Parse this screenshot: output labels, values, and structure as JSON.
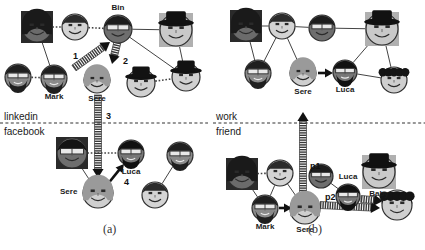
{
  "figure": {
    "panels": [
      {
        "id": "a",
        "caption": "(a)",
        "caption_pos": {
          "x": 103,
          "y": 222
        },
        "network_labels": [
          {
            "name": "linkedin",
            "text": "linkedin",
            "x": 4,
            "y": 112
          },
          {
            "name": "facebook",
            "text": "facebook",
            "x": 4,
            "y": 127
          }
        ],
        "divider_y": 123,
        "divider_x1": 0,
        "divider_x2": 208,
        "nodes": [
          {
            "id": "a1",
            "label": "",
            "x": 37,
            "y": 27,
            "r": 16,
            "shape": "square",
            "skin": "#6b6b6b",
            "hair": "#1a1a1a",
            "hairstyle": "long",
            "glasses": false,
            "hat": false,
            "beard": false
          },
          {
            "id": "a2",
            "label": "",
            "x": 75,
            "y": 27,
            "r": 14,
            "shape": "circle",
            "skin": "#d4d4d4",
            "hair": "#2b2b2b",
            "hairstyle": "short",
            "glasses": false,
            "hat": false,
            "beard": false
          },
          {
            "id": "bin",
            "label": "Bin",
            "x": 118,
            "y": 29,
            "r": 15,
            "shape": "circle",
            "skin": "#6e6e6e",
            "hair": "#1c1c1c",
            "hairstyle": "short",
            "glasses": true,
            "hat": false,
            "beard": false,
            "label_pos": "top"
          },
          {
            "id": "a4",
            "label": "",
            "x": 176,
            "y": 30,
            "r": 17,
            "shape": "square",
            "skin": "#c9c9c9",
            "hair": "#111111",
            "hairstyle": "hat",
            "glasses": false,
            "hat": true,
            "beard": false
          },
          {
            "id": "a5",
            "label": "",
            "x": 18,
            "y": 77,
            "r": 14,
            "shape": "circle",
            "skin": "#8a8a8a",
            "hair": "#1f1f1f",
            "hairstyle": "short",
            "glasses": true,
            "hat": false,
            "beard": true
          },
          {
            "id": "mark",
            "label": "Mark",
            "x": 54,
            "y": 78,
            "r": 14,
            "shape": "circle",
            "skin": "#8a8a8a",
            "hair": "#1f1f1f",
            "hairstyle": "short",
            "glasses": true,
            "hat": false,
            "beard": true,
            "label_pos": "bottom"
          },
          {
            "id": "sere1",
            "label": "Sere",
            "x": 97,
            "y": 80,
            "r": 14,
            "shape": "circle",
            "skin": "#cfcfcf",
            "hair": "#9a9a9a",
            "hairstyle": "long",
            "glasses": false,
            "hat": false,
            "beard": false,
            "label_pos": "bottom"
          },
          {
            "id": "a8",
            "label": "",
            "x": 141,
            "y": 83,
            "r": 15,
            "shape": "circle",
            "skin": "#d0d0d0",
            "hair": "#121212",
            "hairstyle": "hat",
            "glasses": false,
            "hat": true,
            "beard": false
          },
          {
            "id": "a9",
            "label": "",
            "x": 186,
            "y": 77,
            "r": 15,
            "shape": "circle",
            "skin": "#d0d0d0",
            "hair": "#121212",
            "hairstyle": "hat",
            "glasses": false,
            "hat": true,
            "beard": false
          },
          {
            "id": "a10",
            "label": "",
            "x": 72,
            "y": 153,
            "r": 16,
            "shape": "square",
            "skin": "#6e6e6e",
            "hair": "#141414",
            "hairstyle": "short",
            "glasses": true,
            "hat": false,
            "beard": false
          },
          {
            "id": "luca1",
            "label": "Luca",
            "x": 131,
            "y": 153,
            "r": 14,
            "shape": "circle",
            "skin": "#777777",
            "hair": "#111111",
            "hairstyle": "short",
            "glasses": true,
            "hat": false,
            "beard": true,
            "label_pos": "bottom"
          },
          {
            "id": "a12",
            "label": "",
            "x": 180,
            "y": 155,
            "r": 14,
            "shape": "circle",
            "skin": "#8a8a8a",
            "hair": "#1f1f1f",
            "hairstyle": "short",
            "glasses": true,
            "hat": false,
            "beard": true
          },
          {
            "id": "sere2",
            "label": "Sere",
            "x": 98,
            "y": 193,
            "r": 16,
            "shape": "circle",
            "skin": "#cfcfcf",
            "hair": "#9a9a9a",
            "hairstyle": "long",
            "glasses": false,
            "hat": false,
            "beard": false,
            "label_pos": "left"
          },
          {
            "id": "a14",
            "label": "",
            "x": 155,
            "y": 195,
            "r": 14,
            "shape": "circle",
            "skin": "#d4d4d4",
            "hair": "#2b2b2b",
            "hairstyle": "short",
            "glasses": false,
            "hat": false,
            "beard": false
          }
        ],
        "edges": [
          {
            "from": "a1",
            "to": "a2",
            "style": "dotted"
          },
          {
            "from": "a2",
            "to": "bin",
            "style": "dotted"
          },
          {
            "from": "a1",
            "to": "mark",
            "style": "solid"
          },
          {
            "from": "a5",
            "to": "mark",
            "style": "dotted"
          },
          {
            "from": "bin",
            "to": "a4",
            "style": "solid"
          },
          {
            "from": "bin",
            "to": "a9",
            "style": "solid"
          },
          {
            "from": "a4",
            "to": "a9",
            "style": "solid"
          },
          {
            "from": "a8",
            "to": "a9",
            "style": "dotted"
          },
          {
            "from": "a10",
            "to": "sere2",
            "style": "solid"
          },
          {
            "from": "a10",
            "to": "luca1",
            "style": "dotted"
          },
          {
            "from": "a12",
            "to": "a14",
            "style": "solid"
          }
        ],
        "flows": [
          {
            "name": "flow-1",
            "label": "1",
            "label_x": 73,
            "label_y": 52,
            "from": {
              "x": 74,
              "y": 68
            },
            "to": {
              "x": 110,
              "y": 42
            },
            "kind": "hatched"
          },
          {
            "name": "flow-2",
            "label": "2",
            "label_x": 123,
            "label_y": 57,
            "from": {
              "x": 118,
              "y": 40
            },
            "to": {
              "x": 112,
              "y": 64
            },
            "kind": "hatched"
          },
          {
            "name": "flow-3",
            "label": "3",
            "label_x": 106,
            "label_y": 112,
            "from": {
              "x": 98,
              "y": 95
            },
            "to": {
              "x": 98,
              "y": 178
            },
            "kind": "hatched"
          },
          {
            "name": "flow-4",
            "label": "4",
            "label_x": 124,
            "label_y": 178,
            "from": {
              "x": 107,
              "y": 185
            },
            "to": {
              "x": 124,
              "y": 164
            },
            "kind": "solid-arrow"
          }
        ]
      },
      {
        "id": "b",
        "caption": "(b)",
        "caption_pos": {
          "x": 308,
          "y": 222
        },
        "network_labels": [
          {
            "name": "work",
            "text": "work",
            "x": 216,
            "y": 112
          },
          {
            "name": "friend",
            "text": "friend",
            "x": 216,
            "y": 127
          }
        ],
        "divider_y": 123,
        "divider_x1": 213,
        "divider_x2": 425,
        "nodes": [
          {
            "id": "b1",
            "label": "",
            "x": 246,
            "y": 26,
            "r": 16,
            "shape": "square",
            "skin": "#6b6b6b",
            "hair": "#1a1a1a",
            "hairstyle": "long",
            "glasses": false,
            "hat": false,
            "beard": false
          },
          {
            "id": "b2",
            "label": "",
            "x": 282,
            "y": 26,
            "r": 14,
            "shape": "circle",
            "skin": "#d4d4d4",
            "hair": "#2b2b2b",
            "hairstyle": "short",
            "glasses": false,
            "hat": false,
            "beard": false
          },
          {
            "id": "b3",
            "label": "",
            "x": 322,
            "y": 28,
            "r": 14,
            "shape": "circle",
            "skin": "#6e6e6e",
            "hair": "#1c1c1c",
            "hairstyle": "short",
            "glasses": true,
            "hat": false,
            "beard": false
          },
          {
            "id": "b4",
            "label": "",
            "x": 382,
            "y": 29,
            "r": 17,
            "shape": "square",
            "skin": "#c9c9c9",
            "hair": "#111111",
            "hairstyle": "hat",
            "glasses": false,
            "hat": true,
            "beard": false
          },
          {
            "id": "b5",
            "label": "",
            "x": 258,
            "y": 73,
            "r": 14,
            "shape": "circle",
            "skin": "#8a8a8a",
            "hair": "#1f1f1f",
            "hairstyle": "short",
            "glasses": true,
            "hat": false,
            "beard": true
          },
          {
            "id": "sereb1",
            "label": "Sere",
            "x": 303,
            "y": 73,
            "r": 14,
            "shape": "circle",
            "skin": "#cfcfcf",
            "hair": "#9a9a9a",
            "hairstyle": "long",
            "glasses": false,
            "hat": false,
            "beard": false,
            "label_pos": "bottom"
          },
          {
            "id": "lucab1",
            "label": "Luca",
            "x": 345,
            "y": 72,
            "r": 13,
            "shape": "circle",
            "skin": "#777777",
            "hair": "#111111",
            "hairstyle": "short",
            "glasses": true,
            "hat": false,
            "beard": true,
            "label_pos": "bottom"
          },
          {
            "id": "b8",
            "label": "",
            "x": 394,
            "y": 80,
            "r": 14,
            "shape": "circle",
            "skin": "#cfcfcf",
            "hair": "#141414",
            "hairstyle": "curly",
            "glasses": false,
            "hat": false,
            "beard": false
          },
          {
            "id": "b9",
            "label": "",
            "x": 242,
            "y": 174,
            "r": 16,
            "shape": "square",
            "skin": "#6b6b6b",
            "hair": "#1a1a1a",
            "hairstyle": "long",
            "glasses": false,
            "hat": false,
            "beard": false
          },
          {
            "id": "b10",
            "label": "",
            "x": 280,
            "y": 173,
            "r": 14,
            "shape": "circle",
            "skin": "#d4d4d4",
            "hair": "#2b2b2b",
            "hairstyle": "short",
            "glasses": false,
            "hat": false,
            "beard": false
          },
          {
            "id": "b11",
            "label": "",
            "x": 321,
            "y": 176,
            "r": 13,
            "shape": "circle",
            "skin": "#6e6e6e",
            "hair": "#1c1c1c",
            "hairstyle": "short",
            "glasses": true,
            "hat": false,
            "beard": false
          },
          {
            "id": "baby",
            "label": "Baby",
            "x": 379,
            "y": 172,
            "r": 17,
            "shape": "square",
            "skin": "#c9c9c9",
            "hair": "#111111",
            "hairstyle": "hat",
            "glasses": false,
            "hat": true,
            "beard": false,
            "label_pos": "bottom"
          },
          {
            "id": "markb",
            "label": "Mark",
            "x": 265,
            "y": 208,
            "r": 14,
            "shape": "circle",
            "skin": "#8a8a8a",
            "hair": "#1f1f1f",
            "hairstyle": "short",
            "glasses": true,
            "hat": false,
            "beard": true,
            "label_pos": "bottom"
          },
          {
            "id": "sereb2",
            "label": "Sere",
            "x": 305,
            "y": 209,
            "r": 16,
            "shape": "circle",
            "skin": "#cfcfcf",
            "hair": "#9a9a9a",
            "hairstyle": "long",
            "glasses": false,
            "hat": false,
            "beard": false,
            "label_pos": "bottom"
          },
          {
            "id": "lucab2",
            "label": "Luca",
            "x": 348,
            "y": 196,
            "r": 13,
            "shape": "circle",
            "skin": "#777777",
            "hair": "#111111",
            "hairstyle": "short",
            "glasses": true,
            "hat": false,
            "beard": true,
            "label_pos": "top"
          },
          {
            "id": "b16",
            "label": "",
            "x": 397,
            "y": 205,
            "r": 16,
            "shape": "circle",
            "skin": "#cfcfcf",
            "hair": "#141414",
            "hairstyle": "curly",
            "glasses": false,
            "hat": false,
            "beard": false
          }
        ],
        "edges": [
          {
            "from": "b1",
            "to": "b2",
            "style": "solid"
          },
          {
            "from": "b2",
            "to": "b3",
            "style": "solid"
          },
          {
            "from": "b3",
            "to": "b4",
            "style": "solid"
          },
          {
            "from": "b1",
            "to": "b5",
            "style": "solid"
          },
          {
            "from": "b2",
            "to": "b5",
            "style": "solid"
          },
          {
            "from": "b2",
            "to": "sereb1",
            "style": "solid"
          },
          {
            "from": "b4",
            "to": "lucab1",
            "style": "solid"
          },
          {
            "from": "b4",
            "to": "b8",
            "style": "solid"
          },
          {
            "from": "lucab1",
            "to": "b8",
            "style": "solid"
          },
          {
            "from": "b9",
            "to": "b10",
            "style": "dotted"
          },
          {
            "from": "b9",
            "to": "markb",
            "style": "solid"
          },
          {
            "from": "b10",
            "to": "markb",
            "style": "solid"
          },
          {
            "from": "b10",
            "to": "sereb2",
            "style": "solid"
          },
          {
            "from": "b11",
            "to": "lucab2",
            "style": "solid"
          }
        ],
        "flows": [
          {
            "name": "flow-p1",
            "label": "p1",
            "label_x": 310,
            "label_y": 162,
            "from": {
              "x": 303,
              "y": 196
            },
            "to": {
              "x": 303,
              "y": 112
            },
            "kind": "hatched-up"
          },
          {
            "name": "flow-sere-luca",
            "label": "",
            "label_x": 0,
            "label_y": 0,
            "from": {
              "x": 318,
              "y": 73
            },
            "to": {
              "x": 333,
              "y": 73
            },
            "kind": "solid-arrow"
          },
          {
            "name": "flow-mark-sere",
            "label": "",
            "label_x": 0,
            "label_y": 0,
            "from": {
              "x": 279,
              "y": 208
            },
            "to": {
              "x": 292,
              "y": 208
            },
            "kind": "solid-arrow"
          },
          {
            "name": "flow-p2",
            "label": "p2",
            "label_x": 325,
            "label_y": 193,
            "from": {
              "x": 320,
              "y": 205
            },
            "to": {
              "x": 380,
              "y": 208
            },
            "kind": "hatched"
          },
          {
            "name": "flow-luca-baby",
            "label": "",
            "label_x": 0,
            "label_y": 0,
            "from": {
              "x": 361,
              "y": 199
            },
            "to": {
              "x": 383,
              "y": 201
            },
            "kind": "hatched"
          }
        ]
      }
    ]
  },
  "colors": {
    "stroke": "#444444",
    "text": "#1a1a1a",
    "divider": "#333333",
    "hatch": "#3a3a3a",
    "arrow": "#111111"
  }
}
